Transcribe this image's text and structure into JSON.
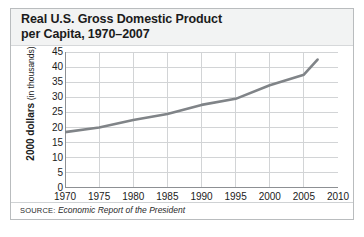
{
  "figure": {
    "title": "Real U.S. Gross Domestic Product\nper Capita, 1970–2007",
    "source_label": "SOURCE:",
    "source_value": "Economic Report of the President",
    "colors": {
      "line": "#808488",
      "grid": "#d2d4d6",
      "axis": "#8d9094",
      "title_band": "#f2f3f3",
      "frame": "#b9bcbe",
      "text": "#1b1b1b"
    }
  },
  "chart_data": {
    "type": "line",
    "title": "Real U.S. Gross Domestic Product per Capita, 1970–2007",
    "xlabel": "",
    "ylabel": "2000 dollars (in thousands)",
    "ylabel_bold_part": "2000 dollars",
    "ylabel_thin_part": "(in thousands)",
    "xlim": [
      1970,
      2010
    ],
    "ylim": [
      0,
      45
    ],
    "grid": true,
    "legend": "none",
    "xticks": [
      1970,
      1975,
      1980,
      1985,
      1990,
      1995,
      2000,
      2005,
      2010
    ],
    "yticks": [
      0,
      5,
      10,
      15,
      20,
      25,
      30,
      35,
      40,
      45
    ],
    "series": [
      {
        "name": "Real GDP per capita",
        "x": [
          1970,
          1975,
          1980,
          1985,
          1990,
          1995,
          2000,
          2005,
          2007
        ],
        "values": [
          18.5,
          20.0,
          22.5,
          24.5,
          27.5,
          29.5,
          34.0,
          37.5,
          42.5
        ]
      }
    ]
  }
}
